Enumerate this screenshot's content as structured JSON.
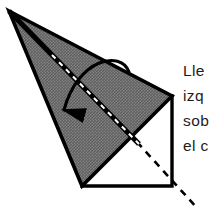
{
  "figure": {
    "background_color": "#ffffff",
    "ink_color": "#000000",
    "fill_color": "#707070",
    "fill_pattern": "crosshatch",
    "shapes": {
      "shaded_triangle": {
        "name": "shaded-folded-flap",
        "points": "9,11 172,96 82,186",
        "fill": "#707070",
        "stroke": "#000000",
        "stroke_width": 3.5
      },
      "base_outline": {
        "name": "square-base-outline",
        "points": "82,186 172,186 172,96",
        "stroke": "#000000",
        "stroke_width": 3.5
      },
      "fold_crease": {
        "name": "fold-crease-line",
        "from": "9,11",
        "to": "137,142",
        "stroke": "#000000",
        "stroke_width": 5,
        "overlay_dash": "#ffffff"
      },
      "dashed_diagonal": {
        "name": "dashed-diagonal-guide",
        "from": "137,142",
        "to": "196,207",
        "stroke": "#000000",
        "stroke_width": 2.6,
        "dash": "7 6"
      },
      "motion_arrow": {
        "name": "fold-direction-arrow",
        "path": "M 128,71 C 120,53 80,62 63,112",
        "stroke": "#000000",
        "stroke_width": 3.2,
        "arrowhead_at": "63,128",
        "direction": "down-left"
      }
    }
  },
  "annotation": {
    "language": "es",
    "clipped_right": true,
    "lines": [
      "Lle",
      "izq",
      "sob",
      "el c"
    ],
    "full_text_visible": "Lle izq sob el c",
    "color": "#1d1d1d"
  }
}
